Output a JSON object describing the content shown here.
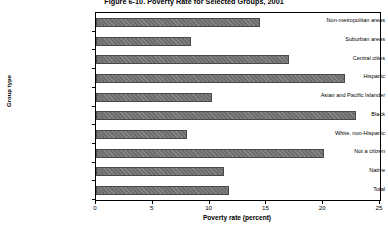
{
  "chart_data": {
    "type": "bar",
    "orientation": "horizontal",
    "title": "Figure 6-10. Poverty Rate for Selected Groups, 2001",
    "xlabel": "Poverty rate (percent)",
    "ylabel": "Group type",
    "xlim": [
      0,
      25
    ],
    "xticks": [
      0,
      5,
      10,
      15,
      20,
      25
    ],
    "grid": false,
    "legend": false,
    "categories": [
      "Non-metropolitan areas",
      "Suburban areas",
      "Central cities",
      "Hispanic",
      "Asian and Pacific Islander",
      "Black",
      "White, non-Hispanic",
      "Not a citizen",
      "Native",
      "Total"
    ],
    "values": [
      14.4,
      8.4,
      17.0,
      21.9,
      10.2,
      22.9,
      8.0,
      20.1,
      11.3,
      11.7
    ],
    "bar_color": "#6e6e6e"
  }
}
